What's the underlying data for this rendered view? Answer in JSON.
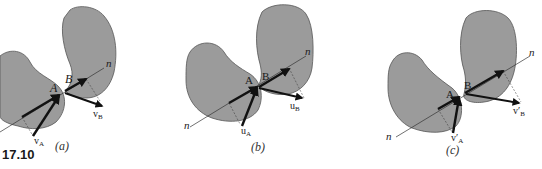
{
  "figure": {
    "number": "17.10",
    "colors": {
      "body_fill": "#9b9b9b",
      "body_stroke": "#5a5a5a",
      "vector": "#111111",
      "line": "#333333",
      "background": "#ffffff"
    },
    "panels": [
      {
        "id": "a",
        "caption": "(a)",
        "point_a": "A",
        "point_b": "B",
        "normal_label": "n",
        "vector_a": {
          "base": "v",
          "sub": "A"
        },
        "vector_b": {
          "base": "v",
          "sub": "B"
        }
      },
      {
        "id": "b",
        "caption": "(b)",
        "point_a": "A",
        "point_b": "B",
        "normal_label": "n",
        "normal_label_2": "n",
        "vector_a": {
          "base": "u",
          "sub": "A"
        },
        "vector_b": {
          "base": "u",
          "sub": "B"
        }
      },
      {
        "id": "c",
        "caption": "(c)",
        "point_a": "A",
        "point_b": "B",
        "normal_label": "n",
        "normal_label_2": "n",
        "vector_a": {
          "base": "v′",
          "sub": "A"
        },
        "vector_b": {
          "base": "v′",
          "sub": "B"
        }
      }
    ]
  }
}
